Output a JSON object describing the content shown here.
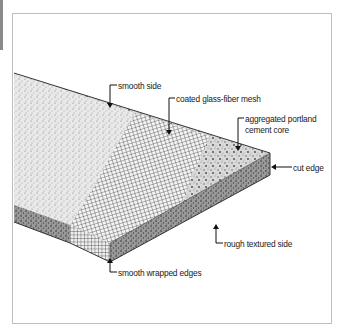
{
  "figure": {
    "labels": {
      "smooth_side": "smooth side",
      "mesh": "coated glass-fiber mesh",
      "core_line1": "aggregated portland",
      "core_line2": "cement core",
      "cut_edge": "cut edge",
      "rough_side": "rough textured side",
      "wrapped_edges": "smooth wrapped edges"
    },
    "colors": {
      "frame_border": "#bdbdbd",
      "left_strip": "#8a8a8a",
      "ink": "#1a1a1a",
      "background": "#ffffff"
    }
  }
}
